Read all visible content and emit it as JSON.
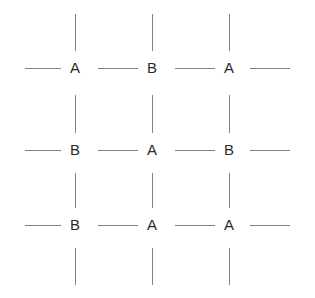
{
  "diagram": {
    "width": 315,
    "height": 298,
    "background_color": "#ffffff",
    "bond_color": "#8a7f74",
    "label_color": "#2b2b2b",
    "grid": {
      "rows": 3,
      "columns": 3,
      "column_x": [
        75,
        152,
        229
      ],
      "row_y": [
        68,
        150,
        225
      ]
    },
    "sites": [
      {
        "row": 0,
        "col": 0,
        "label": "A",
        "x": 75,
        "y": 68
      },
      {
        "row": 0,
        "col": 1,
        "label": "B",
        "x": 152,
        "y": 68
      },
      {
        "row": 0,
        "col": 2,
        "label": "A",
        "x": 229,
        "y": 68
      },
      {
        "row": 1,
        "col": 0,
        "label": "B",
        "x": 75,
        "y": 150
      },
      {
        "row": 1,
        "col": 1,
        "label": "A",
        "x": 152,
        "y": 150
      },
      {
        "row": 1,
        "col": 2,
        "label": "B",
        "x": 229,
        "y": 150
      },
      {
        "row": 2,
        "col": 0,
        "label": "B",
        "x": 75,
        "y": 225
      },
      {
        "row": 2,
        "col": 1,
        "label": "A",
        "x": 152,
        "y": 225
      },
      {
        "row": 2,
        "col": 2,
        "label": "A",
        "x": 229,
        "y": 225
      }
    ],
    "horizontal_bonds": [
      {
        "row": 0,
        "x": 25,
        "y": 68,
        "length": 36
      },
      {
        "row": 0,
        "x": 98,
        "y": 68,
        "length": 40
      },
      {
        "row": 0,
        "x": 175,
        "y": 68,
        "length": 40
      },
      {
        "row": 0,
        "x": 250,
        "y": 68,
        "length": 40
      },
      {
        "row": 1,
        "x": 25,
        "y": 150,
        "length": 36
      },
      {
        "row": 1,
        "x": 98,
        "y": 150,
        "length": 40
      },
      {
        "row": 1,
        "x": 175,
        "y": 150,
        "length": 40
      },
      {
        "row": 1,
        "x": 250,
        "y": 150,
        "length": 40
      },
      {
        "row": 2,
        "x": 25,
        "y": 225,
        "length": 36
      },
      {
        "row": 2,
        "x": 98,
        "y": 225,
        "length": 40
      },
      {
        "row": 2,
        "x": 175,
        "y": 225,
        "length": 40
      },
      {
        "row": 2,
        "x": 250,
        "y": 225,
        "length": 40
      }
    ],
    "vertical_bonds": [
      {
        "col": 0,
        "x": 75,
        "y": 14,
        "length": 37
      },
      {
        "col": 1,
        "x": 152,
        "y": 14,
        "length": 37
      },
      {
        "col": 2,
        "x": 229,
        "y": 14,
        "length": 37
      },
      {
        "col": 0,
        "x": 75,
        "y": 95,
        "length": 38
      },
      {
        "col": 1,
        "x": 152,
        "y": 95,
        "length": 38
      },
      {
        "col": 2,
        "x": 229,
        "y": 95,
        "length": 38
      },
      {
        "col": 0,
        "x": 75,
        "y": 173,
        "length": 35
      },
      {
        "col": 1,
        "x": 152,
        "y": 173,
        "length": 35
      },
      {
        "col": 2,
        "x": 229,
        "y": 173,
        "length": 35
      },
      {
        "col": 0,
        "x": 75,
        "y": 248,
        "length": 37
      },
      {
        "col": 1,
        "x": 152,
        "y": 248,
        "length": 37
      },
      {
        "col": 2,
        "x": 229,
        "y": 248,
        "length": 37
      }
    ]
  }
}
